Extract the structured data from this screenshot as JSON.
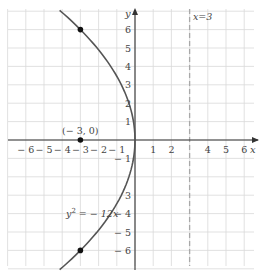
{
  "chart_data": {
    "type": "line",
    "title": "",
    "xlabel": "x",
    "ylabel": "y",
    "xlim": [
      -7,
      7
    ],
    "ylim": [
      -7,
      7
    ],
    "grid": true,
    "x_ticks": [
      -6,
      -5,
      -4,
      -3,
      -2,
      -1,
      1,
      2,
      4,
      5,
      6
    ],
    "x_tick_labels": [
      "− 6",
      "− 5",
      "− 4",
      "− 3",
      "− 2",
      "− 1",
      "1",
      "2",
      "4",
      "5",
      "6"
    ],
    "y_ticks": [
      6,
      5,
      4,
      3,
      2,
      1,
      -1,
      -3,
      -4,
      -5,
      -6
    ],
    "y_tick_labels": [
      "6",
      "5",
      "4",
      "3",
      "2",
      "1",
      "− 1",
      "3",
      "− 4",
      "− 5",
      "− 6"
    ],
    "series": [
      {
        "name": "y^2 = -12x",
        "kind": "parabola",
        "equation": "y² = − 12x",
        "points": [
          [
            -4.08,
            7
          ],
          [
            -3,
            6
          ],
          [
            -2.08,
            5
          ],
          [
            -1.33,
            4
          ],
          [
            -0.75,
            3
          ],
          [
            -0.33,
            2
          ],
          [
            -0.08,
            1
          ],
          [
            0,
            0
          ],
          [
            -0.08,
            -1
          ],
          [
            -0.33,
            -2
          ],
          [
            -0.75,
            -3
          ],
          [
            -1.33,
            -4
          ],
          [
            -2.08,
            -5
          ],
          [
            -3,
            -6
          ],
          [
            -4.08,
            -7
          ]
        ],
        "color": "#555555"
      },
      {
        "name": "x = 3",
        "kind": "directrix",
        "style": "dashed",
        "points": [
          [
            3,
            -7
          ],
          [
            3,
            7
          ]
        ],
        "color": "#999999"
      }
    ],
    "marked_points": [
      {
        "x": -3,
        "y": 0,
        "label": "(− 3, 0)"
      },
      {
        "x": -3,
        "y": 6,
        "label": ""
      },
      {
        "x": -3,
        "y": -6,
        "label": ""
      }
    ],
    "annotations": [
      {
        "text": "x = 3",
        "near": [
          3.3,
          6.6
        ]
      },
      {
        "text": "y² = − 12x",
        "near": [
          -4,
          -4
        ]
      }
    ]
  },
  "labels": {
    "x_axis": "x",
    "y_axis": "y",
    "directrix": "x=3",
    "focus": "(− 3, 0)",
    "equation_base": "y",
    "equation_sup": "2",
    "equation_rest": " = − 12x"
  }
}
